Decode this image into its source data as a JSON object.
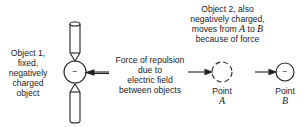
{
  "object1": {
    "lines": [
      "Object 1,",
      "fixed,",
      "negatively",
      "charged",
      "object"
    ],
    "charge": "−"
  },
  "force": {
    "lines": [
      "Force of repulsion",
      "due to",
      "electric field",
      "between objects"
    ]
  },
  "object2": {
    "lines": [
      "Object 2, also",
      "negatively charged,"
    ],
    "moves_prefix": "moves from ",
    "from": "A",
    "to_word": " to ",
    "to": "B",
    "last": "because of force"
  },
  "pointA": {
    "label": "Point",
    "letter": "A"
  },
  "pointB": {
    "label": "Point",
    "letter": "B",
    "charge": "−"
  }
}
